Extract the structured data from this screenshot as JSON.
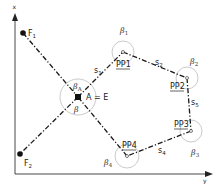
{
  "diagram": {
    "axes": {
      "vertical_label": "x",
      "horizontal_label": "y"
    },
    "points": {
      "F1": {
        "label": "F",
        "sub": "1",
        "x": 23,
        "y": 33
      },
      "F2": {
        "label": "F",
        "sub": "2",
        "x": 20,
        "y": 154
      },
      "AE": {
        "label": "A = E",
        "x": 78,
        "y": 97
      },
      "PP1": {
        "label": "PP1",
        "x": 123,
        "y": 52
      },
      "PP2": {
        "label": "PP2",
        "x": 187,
        "y": 78
      },
      "PP3": {
        "label": "PP3",
        "x": 191,
        "y": 131
      },
      "PP4": {
        "label": "PP4",
        "x": 127,
        "y": 156
      }
    },
    "segments": [
      {
        "label": "s",
        "sub": "1"
      },
      {
        "label": "s",
        "sub": "2"
      },
      {
        "label": "s",
        "sub": "5"
      },
      {
        "label": "s",
        "sub": "4"
      }
    ],
    "angles": [
      {
        "label": "β",
        "sub": "A"
      },
      {
        "label": "β",
        "sub": ""
      },
      {
        "label": "β",
        "sub": "1"
      },
      {
        "label": "β",
        "sub": "2"
      },
      {
        "label": "β",
        "sub": "3"
      },
      {
        "label": "β",
        "sub": "4"
      }
    ],
    "colors": {
      "line": "#1a1a1a",
      "arc": "#bdbdbd"
    }
  }
}
